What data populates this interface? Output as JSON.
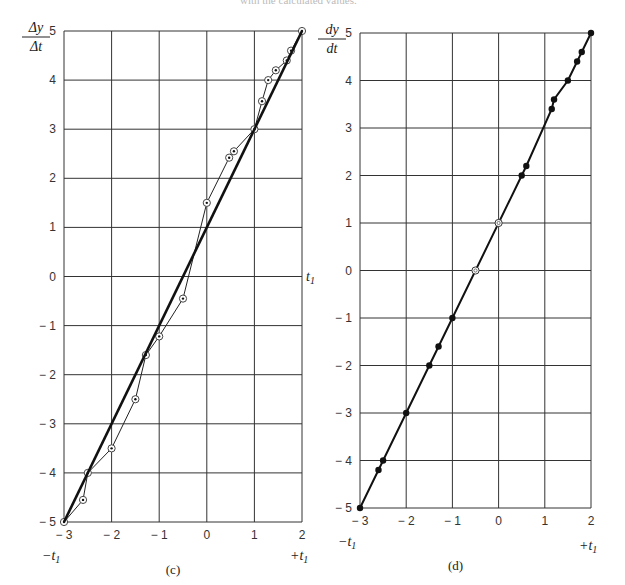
{
  "header": {
    "cropped_text": "with the calculated values."
  },
  "chart_data": [
    {
      "type": "line",
      "panel": "c",
      "caption": "(c)",
      "ylabel": "Δy/Δt",
      "ylabel_num": "Δy",
      "ylabel_den": "Δt",
      "xlabel_left": "−t",
      "xlabel_right": "+t",
      "subscript": "1",
      "side_label": "t",
      "xlim": [
        -3,
        2
      ],
      "ylim": [
        -5,
        5
      ],
      "xticks": [
        -3,
        -2,
        -1,
        0,
        1,
        2
      ],
      "yticks": [
        5,
        4,
        3,
        2,
        1,
        0,
        -1,
        -2,
        -3,
        -4,
        -5
      ],
      "grid": true,
      "series": [
        {
          "name": "finite-difference estimate",
          "marker": "open-circle-dot",
          "x": [
            -3,
            -2.6,
            -2.5,
            -2.0,
            -1.5,
            -1.28,
            -1.0,
            -0.5,
            0.0,
            0.47,
            0.57,
            1.0,
            1.16,
            1.29,
            1.45,
            1.68,
            1.77,
            2.0
          ],
          "y": [
            -5,
            -4.55,
            -4.0,
            -3.5,
            -2.5,
            -1.6,
            -1.22,
            -0.45,
            1.5,
            2.42,
            2.55,
            3.0,
            3.57,
            4.0,
            4.2,
            4.4,
            4.6,
            5.0
          ]
        },
        {
          "name": "exact derivative",
          "marker": "none",
          "x": [
            -3,
            2
          ],
          "y": [
            -5,
            5
          ]
        }
      ]
    },
    {
      "type": "line",
      "panel": "d",
      "caption": "(d)",
      "ylabel": "dy/dt",
      "ylabel_num": "dy",
      "ylabel_den": "dt",
      "xlabel_left": "−t",
      "xlabel_right": "+t",
      "subscript": "1",
      "xlim": [
        -3,
        2
      ],
      "ylim": [
        -5,
        5
      ],
      "xticks": [
        -3,
        -2,
        -1,
        0,
        1,
        2
      ],
      "yticks": [
        5,
        4,
        3,
        2,
        1,
        0,
        -1,
        -2,
        -3,
        -4,
        -5
      ],
      "grid": true,
      "series": [
        {
          "name": "calculated derivative",
          "marker": "filled-dot",
          "x": [
            -3,
            -2.6,
            -2.5,
            -2.0,
            -1.5,
            -1.3,
            -1.0,
            0.5,
            0.6,
            1.15,
            1.2,
            1.5,
            1.7,
            1.8,
            2.0
          ],
          "y": [
            -5,
            -4.2,
            -4.0,
            -3.0,
            -2.0,
            -1.6,
            -1.0,
            2.0,
            2.2,
            3.4,
            3.6,
            4.0,
            4.4,
            4.6,
            5.0
          ]
        },
        {
          "name": "open points",
          "marker": "open-circle",
          "x": [
            -0.5,
            0.0
          ],
          "y": [
            0.0,
            1.0
          ]
        }
      ]
    }
  ]
}
